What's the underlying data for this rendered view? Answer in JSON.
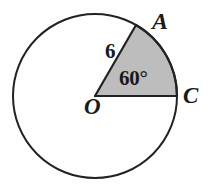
{
  "figure": {
    "type": "circle-sector-diagram",
    "background_color": "#fefefe",
    "stroke_color": "#222222",
    "sector_fill_color": "#bdbdbd",
    "circle": {
      "center_label": "O",
      "center_x": 95,
      "center_y": 96,
      "radius_px": 82
    },
    "points": [
      {
        "name": "A",
        "label": "A",
        "x": 153,
        "y": 40
      },
      {
        "name": "C",
        "label": "C",
        "x": 177,
        "y": 96
      },
      {
        "name": "O",
        "label": "O",
        "x": 95,
        "y": 96
      }
    ],
    "sector": {
      "vertex": "O",
      "from_point": "C",
      "to_point": "A",
      "angle_label": "60°",
      "angle_degrees": 60,
      "radius_label": "6",
      "radius_value": 6,
      "shaded": true
    },
    "labels": {
      "point_a": "A",
      "point_c": "C",
      "point_o": "O",
      "radius": "6",
      "angle": "60°"
    }
  }
}
